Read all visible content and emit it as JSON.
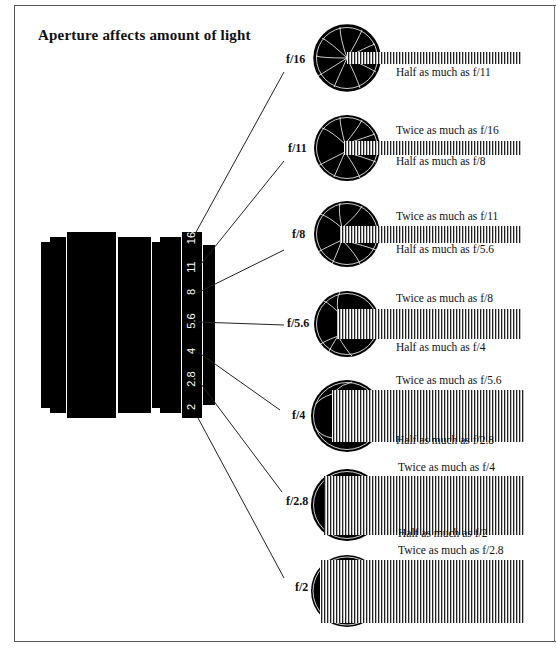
{
  "title": "Aperture affects amount of light",
  "lens_scale": [
    "16",
    "11",
    "8",
    "5.6",
    "4",
    "2.8",
    "2"
  ],
  "stops": [
    {
      "label": "f/16",
      "twice": "",
      "half": "Half as much as f/11"
    },
    {
      "label": "f/11",
      "twice": "Twice as much as f/16",
      "half": "Half as much as f/8"
    },
    {
      "label": "f/8",
      "twice": "Twice as much as f/11",
      "half": "Half as much as f/5.6"
    },
    {
      "label": "f/5.6",
      "twice": "Twice as much as f/8",
      "half": "Half as much as f/4"
    },
    {
      "label": "f/4",
      "twice": "Twice as much as f/5.6",
      "half": "Half as much as f/2.8"
    },
    {
      "label": "f/2.8",
      "twice": "Twice as much as f/4",
      "half": "Half as much as f/2"
    },
    {
      "label": "f/2",
      "twice": "Twice as much as f/2.8",
      "half": ""
    }
  ]
}
